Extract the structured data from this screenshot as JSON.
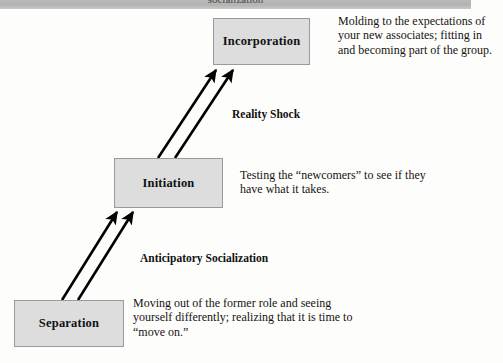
{
  "header": {
    "clipped_title": "socialization"
  },
  "diagram": {
    "stages": [
      {
        "id": "incorporation",
        "label": "Incorporation",
        "description": "Molding to the expectations of your new associates; fitting in and becoming part of the group."
      },
      {
        "id": "initiation",
        "label": "Initiation",
        "description": "Testing the “newcomers” to see if they have what it takes."
      },
      {
        "id": "separation",
        "label": "Separation",
        "description": "Moving out of the former role and seeing yourself differently; realizing that it is time to “move on.”"
      }
    ],
    "transitions": [
      {
        "id": "reality-shock",
        "label": "Reality Shock",
        "from": "initiation",
        "to": "incorporation"
      },
      {
        "id": "anticipatory-socialization",
        "label": "Anticipatory Socialization",
        "from": "separation",
        "to": "initiation"
      }
    ],
    "colors": {
      "box_fill": "#dddddd",
      "box_border": "#9a9a9a",
      "arrow": "#000000",
      "text": "#17130f",
      "header_band": "#b5b5b5",
      "background": "#fdfdfc"
    }
  }
}
